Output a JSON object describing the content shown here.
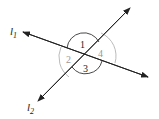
{
  "diagram": {
    "type": "intersecting-lines-angles",
    "lines": [
      {
        "id": "l1",
        "label": "l",
        "subscript": "1"
      },
      {
        "id": "l2",
        "label": "l",
        "subscript": "2"
      }
    ],
    "angles": [
      {
        "label": "1",
        "arc": "dark"
      },
      {
        "label": "2",
        "arc": "light"
      },
      {
        "label": "3",
        "arc": "dark"
      },
      {
        "label": "4",
        "arc": "light"
      }
    ],
    "colors": {
      "line": "#222222",
      "dark_arc": "#333333",
      "light_arc": "#aaaaaa",
      "light_label": "#999999"
    }
  }
}
